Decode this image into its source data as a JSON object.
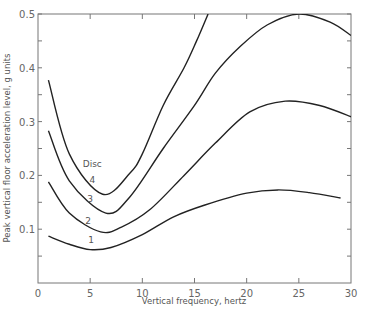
{
  "chart_data": {
    "type": "line",
    "title": "",
    "xlabel": "Vertical frequency, hertz",
    "ylabel": "Peak vertical floor acceleration level, g units",
    "xlim": [
      0,
      30
    ],
    "ylim": [
      0,
      0.5
    ],
    "x_ticks": [
      0,
      5,
      10,
      15,
      20,
      25,
      30
    ],
    "x_tick_labels": [
      "0",
      "5",
      "10",
      "15",
      "20",
      "25",
      "30"
    ],
    "y_ticks": [
      0.1,
      0.2,
      0.3,
      0.4,
      0.5
    ],
    "y_tick_labels": [
      "0.1",
      "0.2",
      "0.3",
      "0.4",
      "0.5"
    ],
    "grid": false,
    "legend": {
      "title": "Disc",
      "position": "inline labels near curve minima"
    },
    "series": [
      {
        "name": "1",
        "x": [
          1,
          3,
          5,
          7,
          10,
          13,
          16,
          20,
          23,
          26,
          29
        ],
        "values": [
          0.087,
          0.072,
          0.062,
          0.066,
          0.09,
          0.123,
          0.145,
          0.167,
          0.173,
          0.168,
          0.158
        ]
      },
      {
        "name": "2",
        "x": [
          1,
          3,
          6,
          8,
          10.7,
          14,
          17,
          20.3,
          23.7,
          27,
          30
        ],
        "values": [
          0.188,
          0.13,
          0.095,
          0.104,
          0.136,
          0.2,
          0.26,
          0.318,
          0.338,
          0.33,
          0.309
        ]
      },
      {
        "name": "3",
        "x": [
          1,
          3,
          6.5,
          8.8,
          12,
          15,
          17,
          19.4,
          22,
          25,
          28,
          30
        ],
        "values": [
          0.283,
          0.19,
          0.13,
          0.16,
          0.25,
          0.33,
          0.39,
          0.44,
          0.48,
          0.5,
          0.485,
          0.46
        ]
      },
      {
        "name": "4",
        "x": [
          1,
          3,
          6.2,
          8.8,
          10,
          12,
          14,
          15.2,
          16.3
        ],
        "values": [
          0.377,
          0.24,
          0.165,
          0.204,
          0.24,
          0.33,
          0.4,
          0.45,
          0.5
        ]
      }
    ],
    "annotations": [
      {
        "text": "Disc",
        "x": 5.2,
        "y": 0.215
      },
      {
        "text": "4",
        "x": 5.2,
        "y": 0.185
      },
      {
        "text": "3",
        "x": 5.0,
        "y": 0.15
      },
      {
        "text": "2",
        "x": 4.8,
        "y": 0.11
      },
      {
        "text": "1",
        "x": 5.1,
        "y": 0.075
      }
    ]
  }
}
